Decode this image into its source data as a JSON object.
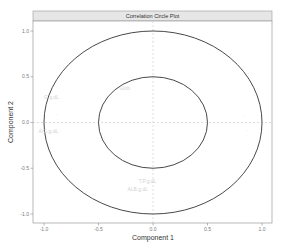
{
  "chart_data": {
    "type": "scatter",
    "subtype": "correlation-circle",
    "title": "Correlation Circle Plot",
    "xlabel": "Component 1",
    "ylabel": "Component 2",
    "xlim": [
      -1.0,
      1.0
    ],
    "ylim": [
      -1.0,
      1.0
    ],
    "x_ticks": [
      "-1.0",
      "-0.5",
      "0.0",
      "0.5",
      "1.0"
    ],
    "y_ticks": [
      "1.0",
      "0.5",
      "0.0",
      "-0.5",
      "-1.0"
    ],
    "grid": false,
    "reference_lines": {
      "x": 0,
      "y": 0,
      "style": "dashed"
    },
    "circles": [
      {
        "radius": 1.0
      },
      {
        "radius": 0.5
      }
    ],
    "points": [
      {
        "label": "G.g.dL",
        "x": -0.93,
        "y": 0.27
      },
      {
        "label": "",
        "x": -0.88,
        "y": 0.09
      },
      {
        "label": "A/G.g.dL",
        "x": -0.96,
        "y": -0.1
      },
      {
        "label": "",
        "x": -0.85,
        "y": -0.09
      },
      {
        "label": "Glob",
        "x": -0.26,
        "y": 0.37
      },
      {
        "label": "",
        "x": 0.0,
        "y": 0.9
      },
      {
        "label": "",
        "x": 0.83,
        "y": 0.08
      },
      {
        "label": "",
        "x": 0.86,
        "y": -0.09
      },
      {
        "label": "T.P.g.dL",
        "x": -0.05,
        "y": -0.64
      },
      {
        "label": "ALB.g.dL",
        "x": -0.14,
        "y": -0.73
      }
    ]
  },
  "strip": {
    "title": "Correlation Circle Plot"
  },
  "axes": {
    "x_title": "Component 1",
    "y_title": "Component 2"
  }
}
